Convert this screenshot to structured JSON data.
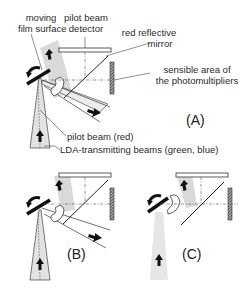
{
  "labels": {
    "moving_film_surface": [
      "moving",
      "film surface"
    ],
    "pilot_beam_detector": [
      "pilot beam",
      "detector"
    ],
    "red_reflective_mirror": [
      "red reflective",
      "mirror"
    ],
    "sensible_area": [
      "sensible area of",
      "the photomultipliers"
    ],
    "pilot_beam": "pilot beam (red)",
    "lda_beams": "LDA-transmitting beams (green, blue)"
  },
  "panels": {
    "a": "(A)",
    "b": "(B)",
    "c": "(C)"
  },
  "colors": {
    "line": "#222222",
    "beam_fill": "#d9d9d9",
    "photomultiplier": "#8a8a8a"
  }
}
